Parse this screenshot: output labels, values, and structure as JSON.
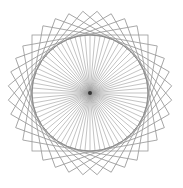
{
  "figure": {
    "center": [
      90,
      93
    ],
    "circle_radius": 58,
    "square_half_side": 58,
    "square_count": 9,
    "square_rotation_step_deg": 10,
    "spoke_count": 72,
    "line_color": "#9a9a9a",
    "circle_color": "#8a8a8a",
    "center_color": "#333333",
    "background": "#ffffff"
  }
}
